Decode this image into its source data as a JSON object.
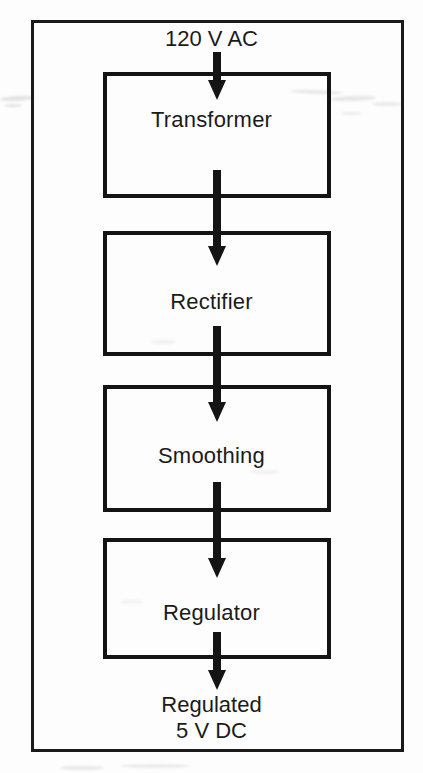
{
  "diagram": {
    "type": "block-diagram",
    "orientation": "vertical top-to-bottom",
    "frame": {
      "visible": true,
      "border_color": "#1a1a1a"
    },
    "background_color": "#fdfdfd",
    "line_color": "#141414",
    "text_color": "#1b1b1b",
    "input": {
      "label": "120 V AC",
      "arrow_direction": "down"
    },
    "stages": [
      {
        "id": "transformer",
        "label": "Transformer"
      },
      {
        "id": "rectifier",
        "label": "Rectifier"
      },
      {
        "id": "smoothing",
        "label": "Smoothing"
      },
      {
        "id": "regulator",
        "label": "Regulator"
      }
    ],
    "connectors": [
      {
        "id": "input-to-transformer",
        "from": "120 V AC",
        "to": "Transformer",
        "direction": "down"
      },
      {
        "id": "transformer-to-rectifier",
        "from": "Transformer",
        "to": "Rectifier",
        "direction": "down"
      },
      {
        "id": "rectifier-to-smoothing",
        "from": "Rectifier",
        "to": "Smoothing",
        "direction": "down"
      },
      {
        "id": "smoothing-to-regulator",
        "from": "Smoothing",
        "to": "Regulator",
        "direction": "down"
      },
      {
        "id": "regulator-to-output",
        "from": "Regulator",
        "to": "Regulated 5 V DC",
        "direction": "down"
      }
    ],
    "output": {
      "line1": "Regulated",
      "line2": "5 V DC",
      "arrow_direction": "down"
    }
  }
}
